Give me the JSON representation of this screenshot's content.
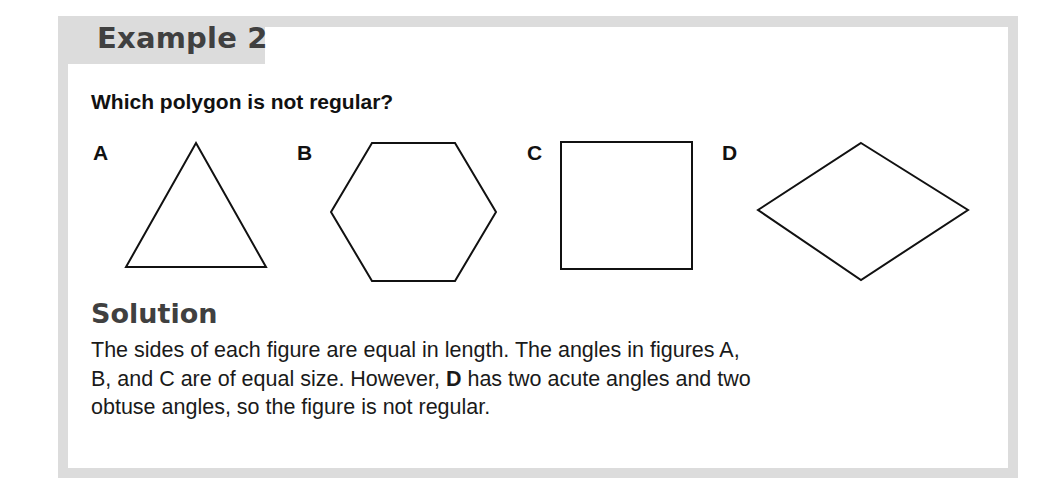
{
  "header": {
    "title": "Example 2"
  },
  "question": "Which polygon is not regular?",
  "options": [
    {
      "label": "A",
      "shape": "equilateral-triangle"
    },
    {
      "label": "B",
      "shape": "regular-hexagon"
    },
    {
      "label": "C",
      "shape": "square"
    },
    {
      "label": "D",
      "shape": "rhombus"
    }
  ],
  "solution": {
    "title": "Solution",
    "line1": "The sides of each figure are equal in length. The angles in figures A,",
    "line2_before": "B, and C are of equal size. However, ",
    "line2_bold": "D",
    "line2_after": " has two acute angles and two",
    "line3": "obtuse angles, so the figure is not regular."
  },
  "colors": {
    "frame": "#dcdcdc",
    "heading": "#404040",
    "text": "#1a1a1a"
  }
}
